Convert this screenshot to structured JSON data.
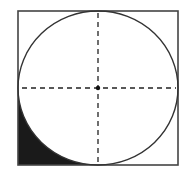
{
  "diagram": {
    "colors": {
      "stroke": "#333333",
      "shade": "#1a1a1a",
      "background": "#ffffff"
    },
    "square": {
      "x": 18,
      "y": 11,
      "width": 160,
      "height": 154
    },
    "circle": {
      "cx": 98,
      "cy": 88,
      "rx": 80,
      "ry": 77
    },
    "center_point": {
      "cx": 98,
      "cy": 88,
      "r": 2.2
    },
    "shaded_region": "bottom-left corner"
  }
}
